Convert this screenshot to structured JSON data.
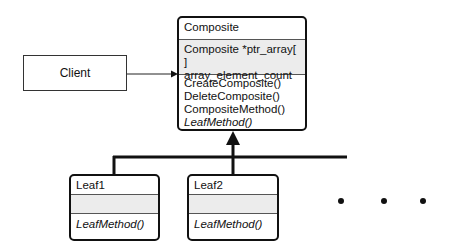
{
  "client": {
    "label": "Client"
  },
  "composite": {
    "name": "Composite",
    "attributes": [
      "Composite  *ptr_array[ ]",
      "array_element_count"
    ],
    "methods": [
      "CreateComposite()",
      "DeleteComposite()",
      "CompositeMethod()",
      "LeafMethod()"
    ]
  },
  "leaves": [
    {
      "name": "Leaf1",
      "method": "LeafMethod()"
    },
    {
      "name": "Leaf2",
      "method": "LeafMethod()"
    }
  ],
  "ellipsis": "• • •"
}
